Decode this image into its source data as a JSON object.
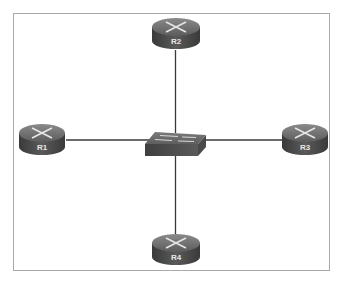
{
  "diagram": {
    "type": "network-topology",
    "topology": "star",
    "center_device": {
      "id": "switch",
      "type": "switch",
      "label": ""
    },
    "devices": [
      {
        "id": "R1",
        "type": "router",
        "label": "R1",
        "position": "left"
      },
      {
        "id": "R2",
        "type": "router",
        "label": "R2",
        "position": "top"
      },
      {
        "id": "R3",
        "type": "router",
        "label": "R3",
        "position": "right"
      },
      {
        "id": "R4",
        "type": "router",
        "label": "R4",
        "position": "bottom"
      }
    ],
    "links": [
      {
        "from": "R1",
        "to": "switch"
      },
      {
        "from": "R2",
        "to": "switch"
      },
      {
        "from": "R3",
        "to": "switch"
      },
      {
        "from": "R4",
        "to": "switch"
      }
    ],
    "colors": {
      "router_body": "#4a4a4a",
      "router_top": "#6e6e6e",
      "switch_top": "#6a6a6a",
      "switch_front": "#4f4f4f",
      "link": "#3a3a3a",
      "frame_border": "#a9a9a9"
    }
  }
}
